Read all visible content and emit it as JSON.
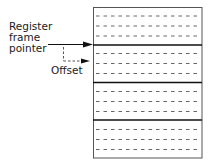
{
  "labels": {
    "register_line1": "Register",
    "register_line2": "frame",
    "register_line3": "pointer",
    "offset": "Offset"
  },
  "diagram": {
    "type": "register-frame-stack",
    "frames": 4,
    "registers_per_frame_visible_dashed": 3,
    "colors": {
      "line": "#1a1a1a",
      "dash": "#555555",
      "background": "#ffffff"
    }
  }
}
